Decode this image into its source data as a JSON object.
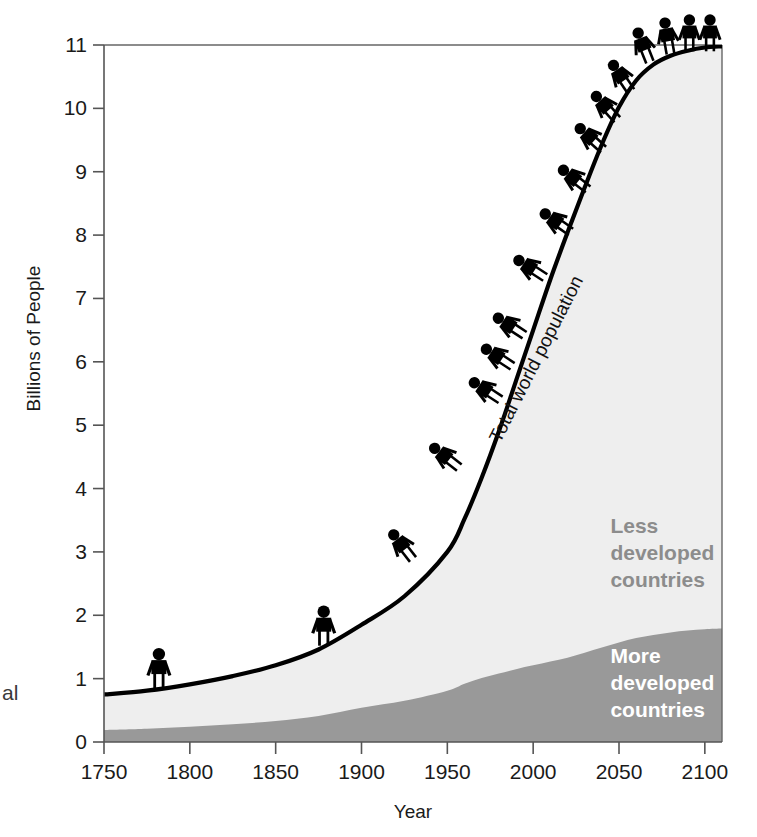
{
  "chart_data": {
    "type": "area",
    "title": "",
    "xlabel": "Year",
    "ylabel": "Billions of People",
    "xlim": [
      1750,
      2110
    ],
    "ylim": [
      0,
      11
    ],
    "grid": false,
    "legend_position": "inline-annotations",
    "x_ticks": [
      1750,
      1800,
      1850,
      1900,
      1950,
      2000,
      2050,
      2100
    ],
    "x_tick_labels": [
      "1750",
      "1800",
      "1850",
      "1900",
      "1950",
      "2000",
      "2050",
      "2100"
    ],
    "y_ticks": [
      0,
      1,
      2,
      3,
      4,
      5,
      6,
      7,
      8,
      9,
      10,
      11
    ],
    "y_tick_labels": [
      "0",
      "1",
      "2",
      "3",
      "4",
      "5",
      "6",
      "7",
      "8",
      "9",
      "10",
      "11"
    ],
    "x": [
      1750,
      1775,
      1800,
      1825,
      1850,
      1875,
      1900,
      1925,
      1950,
      1960,
      1970,
      1980,
      1990,
      2000,
      2010,
      2020,
      2030,
      2040,
      2050,
      2060,
      2070,
      2080,
      2090,
      2100,
      2110
    ],
    "series": [
      {
        "name": "More developed countries",
        "values": [
          0.19,
          0.21,
          0.24,
          0.28,
          0.33,
          0.41,
          0.54,
          0.65,
          0.81,
          0.92,
          1.01,
          1.08,
          1.15,
          1.21,
          1.27,
          1.33,
          1.41,
          1.49,
          1.57,
          1.64,
          1.69,
          1.73,
          1.76,
          1.78,
          1.79
        ],
        "color": "#999999",
        "stacked": true
      },
      {
        "name": "Less developed countries",
        "values": [
          0.56,
          0.6,
          0.67,
          0.76,
          0.88,
          1.05,
          1.31,
          1.65,
          2.19,
          2.6,
          3.16,
          3.82,
          4.55,
          5.29,
          6.03,
          6.71,
          7.34,
          7.94,
          8.45,
          8.8,
          9.0,
          9.1,
          9.15,
          9.18,
          9.19
        ],
        "color": "#eeeeee",
        "stacked": true
      }
    ],
    "total_series": {
      "name": "Total world population",
      "values": [
        0.75,
        0.81,
        0.91,
        1.04,
        1.21,
        1.46,
        1.85,
        2.3,
        3.0,
        3.52,
        4.17,
        4.9,
        5.7,
        6.5,
        7.3,
        8.04,
        8.75,
        9.43,
        10.02,
        10.44,
        10.69,
        10.83,
        10.91,
        10.96,
        10.98
      ],
      "color": "#000000"
    },
    "annotations": [
      {
        "name": "total-curve-label",
        "text": "Total world population",
        "x": 2005,
        "y": 6.0,
        "rotation": -63
      },
      {
        "name": "less-developed-label",
        "text": "Less developed countries",
        "x": 2045,
        "y": 3.3,
        "color": "#8c8c8c"
      },
      {
        "name": "more-developed-label",
        "text": "More developed countries",
        "x": 2045,
        "y": 1.25,
        "color": "#ffffff"
      }
    ],
    "figures": [
      {
        "year": 1782,
        "pop": 0.85,
        "angle": 0,
        "scale": 1.0
      },
      {
        "year": 1878,
        "pop": 1.52,
        "angle": 0,
        "scale": 1.0
      },
      {
        "year": 1930,
        "pop": 2.88,
        "angle": -38,
        "scale": 0.92
      },
      {
        "year": 1957,
        "pop": 4.33,
        "angle": -52,
        "scale": 0.92
      },
      {
        "year": 1981,
        "pop": 5.4,
        "angle": -57,
        "scale": 0.92
      },
      {
        "year": 1988,
        "pop": 5.93,
        "angle": -57,
        "scale": 0.92
      },
      {
        "year": 1995,
        "pop": 6.42,
        "angle": -57,
        "scale": 0.92
      },
      {
        "year": 2007,
        "pop": 7.33,
        "angle": -57,
        "scale": 0.92
      },
      {
        "year": 2022,
        "pop": 8.05,
        "angle": -55,
        "scale": 0.92
      },
      {
        "year": 2032,
        "pop": 8.72,
        "angle": -52,
        "scale": 0.92
      },
      {
        "year": 2041,
        "pop": 9.35,
        "angle": -48,
        "scale": 0.92
      },
      {
        "year": 2049,
        "pop": 9.82,
        "angle": -42,
        "scale": 0.92
      },
      {
        "year": 2057,
        "pop": 10.27,
        "angle": -34,
        "scale": 0.92
      },
      {
        "year": 2068,
        "pop": 10.73,
        "angle": -22,
        "scale": 0.92
      },
      {
        "year": 2080,
        "pop": 10.86,
        "angle": -10,
        "scale": 0.92
      },
      {
        "year": 2091,
        "pop": 10.9,
        "angle": 0,
        "scale": 0.92
      },
      {
        "year": 2103,
        "pop": 10.9,
        "angle": 0,
        "scale": 0.92
      }
    ]
  },
  "caption_fragment": "al",
  "colors": {
    "more_developed": "#999999",
    "less_developed": "#eeeeee",
    "curve": "#000000",
    "axis": "#555555",
    "figure": "#000000"
  }
}
